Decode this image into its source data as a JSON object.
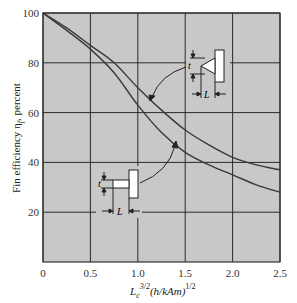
{
  "chart_data": {
    "type": "line",
    "title": "",
    "xlabel": "L_c^{3/2}(h/kA_m)^{1/2}",
    "ylabel": "Fin efficiency η_f, percent",
    "xlim": [
      0,
      2.5
    ],
    "ylim": [
      0,
      100
    ],
    "x_ticks": [
      "0",
      "0.5",
      "1.0",
      "1.5",
      "2.0",
      "2.5"
    ],
    "y_ticks": [
      "20",
      "40",
      "60",
      "80",
      "100"
    ],
    "grid": true,
    "background": "#c8c8c8",
    "series": [
      {
        "name": "Triangular fin",
        "x": [
          0,
          0.25,
          0.5,
          0.75,
          1.0,
          1.25,
          1.5,
          1.75,
          2.0,
          2.25,
          2.5
        ],
        "values": [
          100,
          94,
          87,
          80,
          70,
          61,
          53,
          47,
          42,
          39,
          37
        ]
      },
      {
        "name": "Rectangular fin",
        "x": [
          0,
          0.25,
          0.5,
          0.75,
          1.0,
          1.25,
          1.5,
          1.75,
          2.0,
          2.25,
          2.5
        ],
        "values": [
          100,
          93,
          85.5,
          76,
          63,
          52,
          44,
          39,
          35,
          31,
          28
        ]
      }
    ],
    "annotations": [
      {
        "label": "triangular fin sketch",
        "dims": [
          "t",
          "L"
        ],
        "points_to": "Triangular fin"
      },
      {
        "label": "rectangular fin sketch",
        "dims": [
          "t",
          "L"
        ],
        "points_to": "Rectangular fin"
      }
    ]
  },
  "labels": {
    "y_axis": "Fin efficiency η",
    "y_axis_sub": "f",
    "y_axis_suffix": ", percent",
    "x_axis_main": "L",
    "x_axis_sub": "c",
    "x_axis_sup1": "3/2",
    "x_axis_mid": "(h/kAm)",
    "x_axis_sup2": "1/2",
    "dim_t": "t",
    "dim_L": "L"
  }
}
